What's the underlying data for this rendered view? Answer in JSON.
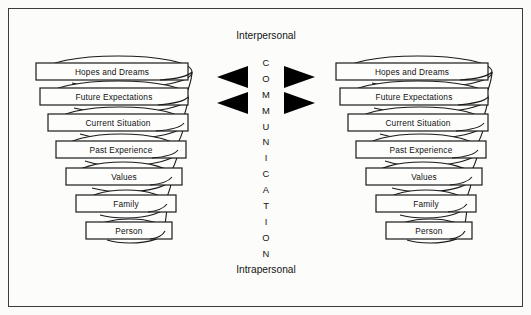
{
  "figure": {
    "background_color": "#fbfbfa",
    "frame_color": "#3b3b3b",
    "ink_color": "#1a1a1a",
    "arrow_color": "#000000"
  },
  "labels": {
    "top": "Interpersonal",
    "bottom": "Intrapersonal"
  },
  "center_axis": {
    "word": "COMMUNICATION",
    "letters": [
      "C",
      "O",
      "M",
      "M",
      "U",
      "N",
      "I",
      "C",
      "A",
      "T",
      "I",
      "O",
      "N"
    ],
    "orientation": "vertical"
  },
  "arrows": {
    "left_pointing_count": 2,
    "right_pointing_count": 2,
    "description": "two solid triangles pointing left toward the left spiral and two pointing right toward the right spiral, aligned with the top two tiers"
  },
  "spirals": [
    {
      "id": "left-spiral",
      "side": "left",
      "tiers": [
        "Hopes and Dreams",
        "Future Expectations",
        "Current Situation",
        "Past Experience",
        "Values",
        "Family",
        "Person"
      ]
    },
    {
      "id": "right-spiral",
      "side": "right",
      "tiers": [
        "Hopes and Dreams",
        "Future Expectations",
        "Current Situation",
        "Past Experience",
        "Values",
        "Family",
        "Person"
      ]
    }
  ],
  "geometry": {
    "left_tier_boxes": [
      {
        "x": 36,
        "y": 63,
        "w": 152,
        "h": 17
      },
      {
        "x": 40,
        "y": 88,
        "w": 148,
        "h": 17
      },
      {
        "x": 48,
        "y": 114,
        "w": 140,
        "h": 17
      },
      {
        "x": 56,
        "y": 141,
        "w": 130,
        "h": 17
      },
      {
        "x": 66,
        "y": 168,
        "w": 116,
        "h": 17
      },
      {
        "x": 76,
        "y": 195,
        "w": 100,
        "h": 17
      },
      {
        "x": 86,
        "y": 222,
        "w": 86,
        "h": 17
      }
    ],
    "right_tier_boxes": [
      {
        "x": 336,
        "y": 63,
        "w": 152,
        "h": 17
      },
      {
        "x": 340,
        "y": 88,
        "w": 148,
        "h": 17
      },
      {
        "x": 348,
        "y": 114,
        "w": 140,
        "h": 17
      },
      {
        "x": 356,
        "y": 141,
        "w": 130,
        "h": 17
      },
      {
        "x": 366,
        "y": 168,
        "w": 116,
        "h": 17
      },
      {
        "x": 376,
        "y": 195,
        "w": 100,
        "h": 17
      },
      {
        "x": 386,
        "y": 222,
        "w": 86,
        "h": 17
      }
    ]
  }
}
